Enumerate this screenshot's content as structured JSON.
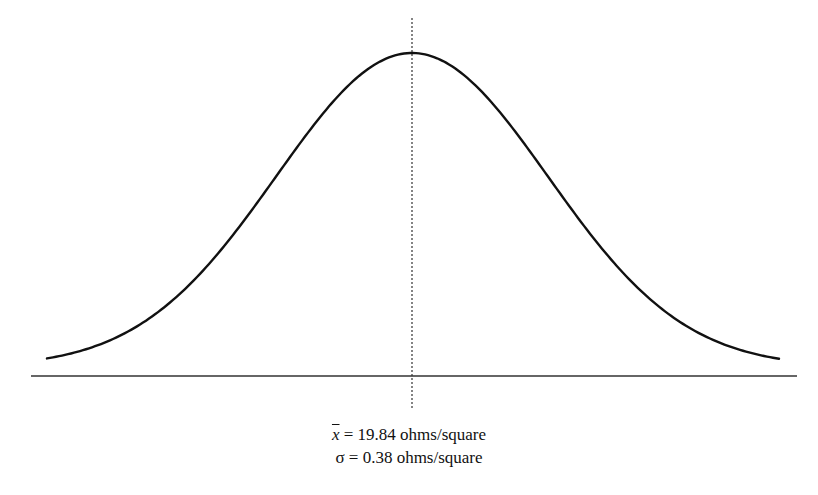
{
  "chart_data": {
    "type": "line",
    "title": "",
    "distribution": "normal",
    "mean": 19.84,
    "std_dev": 0.38,
    "unit": "ohms/square",
    "xlabel": "",
    "ylabel": "",
    "grid": false,
    "legend": null,
    "annotations": [
      {
        "type": "vertical-dotted-line",
        "at": "mean"
      }
    ]
  },
  "captions": {
    "mean_symbol": "x̄",
    "mean_text": " = 19.84 ohms/square",
    "sigma_symbol": "σ",
    "sigma_text": " =  0.38 ohms/square"
  },
  "colors": {
    "curve": "#111111",
    "axis": "#333333",
    "mean_line": "#333333",
    "background": "#ffffff"
  }
}
